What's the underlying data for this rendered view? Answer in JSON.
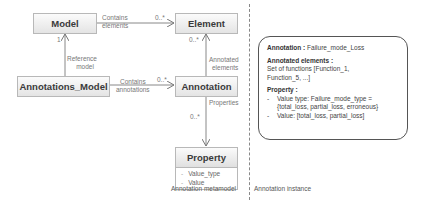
{
  "metamodel": {
    "classes": {
      "model": "Model",
      "element": "Element",
      "annotations_model": "Annotations_Model",
      "annotation": "Annotation",
      "property": "Property"
    },
    "property_attributes": [
      "Value_type",
      "Value"
    ],
    "relations": {
      "contains_elements": {
        "line1": "Contains",
        "line2": "elements",
        "multiplicity": "0..*"
      },
      "reference_model": {
        "line1": "Reference",
        "line2": "model",
        "multiplicity": "1"
      },
      "contains_annotations": {
        "line1": "Contains",
        "line2": "annotations",
        "multiplicity": "0..*"
      },
      "annotated_elements": {
        "line1": "Annotated",
        "line2": "elements",
        "multiplicity": "0..*"
      },
      "properties": {
        "line1": "Properties",
        "multiplicity": "0..*"
      }
    },
    "caption": "Annotation metamodel"
  },
  "instance": {
    "annotation_label": "Annotation :",
    "annotation_value": "Failure_mode_Loss",
    "annotated_label": "Annotated elements :",
    "annotated_value_1": "Set of functions [Function_1,",
    "annotated_value_2": "Function_5, ...]",
    "property_label": "Property :",
    "property_items": [
      {
        "line1": "Value type: Failure_mode_type =",
        "line2": "{total_loss, partial_loss, erroneous}"
      },
      {
        "line1": "Value: [total_loss, partial_loss]"
      }
    ],
    "caption": "Annotation instance"
  }
}
